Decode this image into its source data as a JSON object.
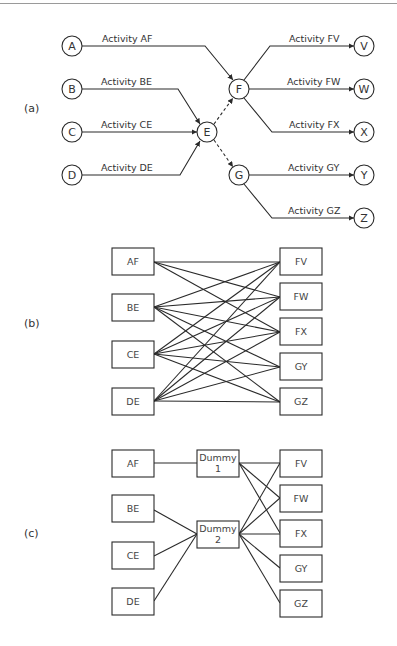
{
  "parts": {
    "a": {
      "label": "(a)"
    },
    "b": {
      "label": "(b)"
    },
    "c": {
      "label": "(c)"
    }
  },
  "network": {
    "nodes": {
      "A": "A",
      "B": "B",
      "C": "C",
      "D": "D",
      "E": "E",
      "F": "F",
      "G": "G",
      "V": "V",
      "W": "W",
      "X": "X",
      "Y": "Y",
      "Z": "Z"
    },
    "activities": {
      "AF": "Activity AF",
      "BE": "Activity BE",
      "CE": "Activity CE",
      "DE": "Activity DE",
      "FV": "Activity FV",
      "FW": "Activity FW",
      "FX": "Activity FX",
      "GY": "Activity GY",
      "GZ": "Activity GZ"
    },
    "dummy_arrows": [
      "E-F",
      "E-G"
    ]
  },
  "bipartite": {
    "left": [
      "AF",
      "BE",
      "CE",
      "DE"
    ],
    "right": [
      "FV",
      "FW",
      "FX",
      "GY",
      "GZ"
    ],
    "edges": {
      "AF": [
        "FV",
        "FW",
        "FX"
      ],
      "BE": [
        "FV",
        "FW",
        "FX",
        "GY",
        "GZ"
      ],
      "CE": [
        "FV",
        "FW",
        "FX",
        "GY",
        "GZ"
      ],
      "DE": [
        "FV",
        "FW",
        "FX",
        "GY",
        "GZ"
      ]
    }
  },
  "dummy_graph": {
    "left": [
      "AF",
      "BE",
      "CE",
      "DE"
    ],
    "dummies": [
      {
        "line1": "Dummy",
        "line2": "1"
      },
      {
        "line1": "Dummy",
        "line2": "2"
      }
    ],
    "right": [
      "FV",
      "FW",
      "FX",
      "GY",
      "GZ"
    ],
    "edges": {
      "AF": [
        "Dummy 1"
      ],
      "BE": [
        "Dummy 2"
      ],
      "CE": [
        "Dummy 2"
      ],
      "DE": [
        "Dummy 2"
      ],
      "Dummy 1": [
        "FV",
        "FW",
        "FX"
      ],
      "Dummy 2": [
        "FV",
        "FW",
        "FX",
        "GY",
        "GZ"
      ]
    }
  }
}
